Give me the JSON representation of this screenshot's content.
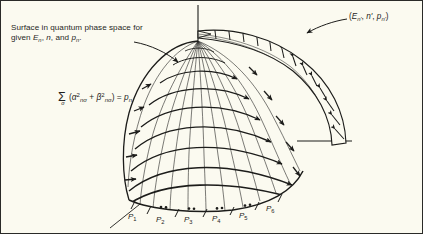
{
  "figure": {
    "background_color": "#fbfaf0",
    "ink_color": "#1c1c1a",
    "border_color": "#2a2a28",
    "width": 423,
    "height": 234
  },
  "caption": {
    "line1": "Surface in quantum phase space for",
    "line2_prefix": "given ",
    "line2_e": "E",
    "line2_e_sub": "n",
    "line2_mid": ", ",
    "line2_n": "n",
    "line2_and": ", and ",
    "line2_p": "p",
    "line2_p_sub": "n",
    "line2_period": "."
  },
  "formula": {
    "sigma": "Σ",
    "sigma_index": "σ",
    "open_paren": "(",
    "alpha": "α",
    "alpha_sup": "2",
    "alpha_sub": "nσ",
    "plus": " + ",
    "beta": "β",
    "beta_sup": "2",
    "beta_sub": "nσ",
    "close_paren": ")",
    "equals": " = ",
    "rhs": "p",
    "rhs_sub": "n",
    "plain_text": "Σσ (α²nσ + β²nσ) = pn"
  },
  "band_label": {
    "open": "(",
    "e": "E",
    "e_sub": "n'",
    "sep1": ", ",
    "n": "n'",
    "sep2": ", ",
    "p": "p",
    "p_sub": "n'",
    "close": ")",
    "plain_text": "(En', n', pn')"
  },
  "axis_ticks": {
    "labels": [
      "P",
      "P",
      "P",
      "P",
      "P",
      "P"
    ],
    "subscripts": [
      "1",
      "2",
      "3",
      "4",
      "5",
      "6"
    ],
    "plain": [
      "P1",
      "P2",
      "P3",
      "P4",
      "P5",
      "P6"
    ],
    "positions": [
      {
        "x": 127,
        "y": 211
      },
      {
        "x": 155,
        "y": 214
      },
      {
        "x": 183,
        "y": 214
      },
      {
        "x": 211,
        "y": 213
      },
      {
        "x": 238,
        "y": 210
      },
      {
        "x": 265,
        "y": 203
      }
    ]
  },
  "geometry": {
    "pole": {
      "x": 197,
      "y": 40
    },
    "vertical_axis": {
      "x": 197,
      "y_top": 5,
      "y_bottom": 40
    },
    "horizontal_axis": {
      "y": 140,
      "x_left": 295,
      "x_right": 350
    },
    "diagonal_axis": {
      "x1": 110,
      "y1": 226,
      "x2": 232,
      "y2": 129
    },
    "dome_left_edge_x": 122,
    "dome_bottom_y": 205,
    "band_start": {
      "x": 197,
      "y": 30
    },
    "band_end": {
      "x": 345,
      "y": 142
    },
    "meridian_count": 12,
    "latitude_count": 9,
    "band_rung_count": 16
  },
  "leaders": {
    "caption_arrow": {
      "from_x": 133,
      "from_y": 41,
      "to_x": 178,
      "to_y": 61
    },
    "band_arrow": {
      "from_x": 345,
      "from_y": 18,
      "to_x": 305,
      "to_y": 32
    }
  }
}
